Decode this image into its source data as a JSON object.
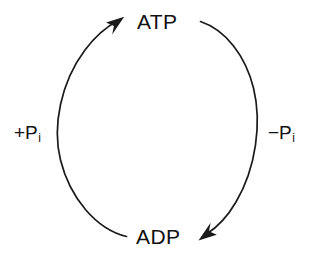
{
  "diagram": {
    "type": "cycle",
    "background_color": "#ffffff",
    "stroke_color": "#1a1a1a",
    "text_color": "#111111",
    "nodes": [
      {
        "id": "atp",
        "label": "ATP",
        "position": "top"
      },
      {
        "id": "adp",
        "label": "ADP",
        "position": "bottom"
      }
    ],
    "edges": [
      {
        "id": "phosphorylation",
        "label": "+P",
        "label_subscript": "i",
        "label_full": "+Pi",
        "side": "left",
        "from": "adp",
        "to": "atp",
        "direction": "upward",
        "arrowhead": "at-atp"
      },
      {
        "id": "hydrolysis",
        "label": "−P",
        "label_subscript": "i",
        "label_full": "−Pi",
        "side": "right",
        "from": "atp",
        "to": "adp",
        "direction": "downward",
        "arrowhead": "at-adp"
      }
    ]
  }
}
